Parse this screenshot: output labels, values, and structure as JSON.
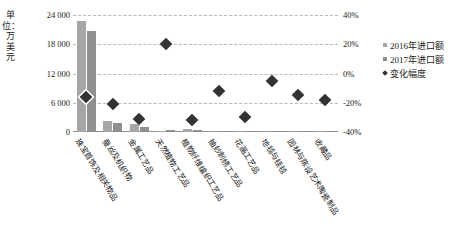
{
  "chart_data": {
    "type": "bar",
    "title": "",
    "xlabel": "",
    "ylabel": "单位：万美元",
    "y2label": "",
    "ylim": [
      0,
      24000
    ],
    "y2lim": [
      -40,
      40
    ],
    "yticks": [
      "0",
      "6 000",
      "12 000",
      "18 000",
      "24 000"
    ],
    "ytick_values": [
      0,
      6000,
      12000,
      18000,
      24000
    ],
    "y2ticks": [
      "-40%",
      "-20%",
      "0%",
      "20%",
      "40%"
    ],
    "y2tick_values": [
      -40,
      -20,
      0,
      20,
      40
    ],
    "grid": true,
    "legend_position": "right",
    "categories": [
      "珠宝首饰及相关物品",
      "蚕丝及机织物",
      "金属工艺品",
      "天然植物工艺品",
      "植物纤维编织工艺品",
      "抽纱刺绣工艺品",
      "花画工艺品",
      "地毯与挂毯",
      "园林与陈设艺术陶瓷制品",
      "收藏品"
    ],
    "series": [
      {
        "name": "2016年进口额",
        "type": "bar",
        "axis": "left",
        "color": "#a6a6a6",
        "values": [
          22800,
          2250,
          1700,
          300,
          700,
          250,
          150,
          90,
          60,
          40
        ]
      },
      {
        "name": "2017年进口额",
        "type": "bar",
        "axis": "left",
        "color": "#8f8f8f",
        "values": [
          20700,
          1850,
          1100,
          400,
          400,
          180,
          110,
          70,
          45,
          25
        ]
      },
      {
        "name": "变化幅度",
        "type": "scatter",
        "axis": "right",
        "color": "#333333",
        "values": [
          -16,
          -21,
          -31,
          20,
          -32,
          -12,
          -30,
          -5,
          -15,
          -18
        ]
      }
    ]
  },
  "legend": {
    "items": [
      {
        "label": "2016年进口额",
        "marker": "square"
      },
      {
        "label": "2017年进口额",
        "marker": "square"
      },
      {
        "label": "变化幅度",
        "marker": "diamond"
      }
    ]
  },
  "colors": {
    "bar_2016": "#a6a6a6",
    "bar_2017": "#8f8f8f",
    "marker": "#333333",
    "grid": "#b9b9b9",
    "axis": "#8c8c8c",
    "text": "#1a1a1a"
  }
}
